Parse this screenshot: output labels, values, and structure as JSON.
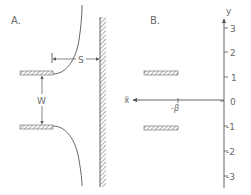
{
  "panels": {
    "a": {
      "label": "A.",
      "dimension_s": "S",
      "dimension_w": "W"
    },
    "b": {
      "label": "B.",
      "x_axis_label": "x̃",
      "y_axis_label": "y",
      "x_tick_label": "-β",
      "y_ticks": [
        "3",
        "2",
        "1",
        "0",
        "-1",
        "-2",
        "-3"
      ]
    }
  },
  "colors": {
    "line": "#555555",
    "hatch": "#888888",
    "text": "#6a6a6a"
  }
}
